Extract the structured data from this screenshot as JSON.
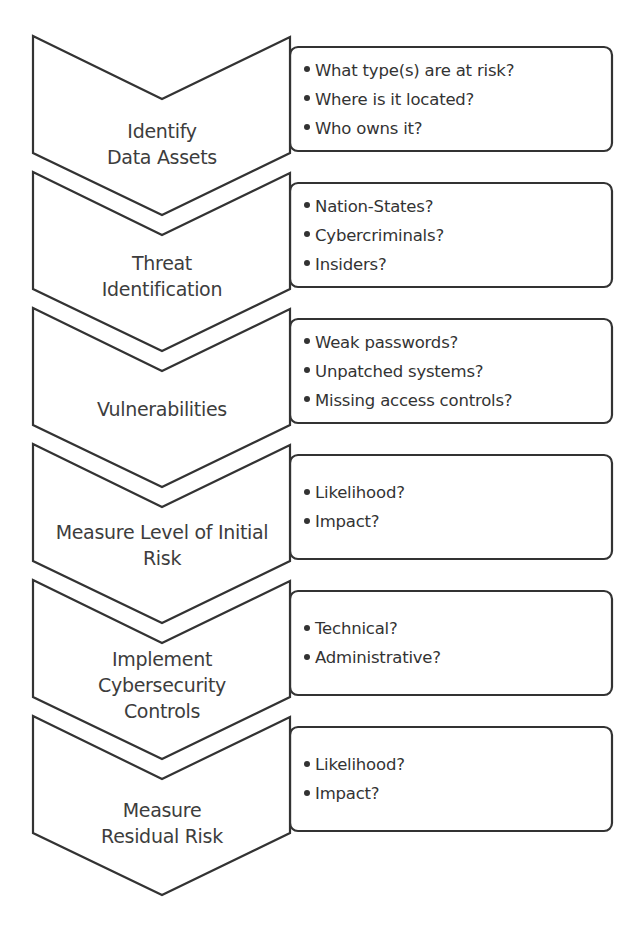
{
  "diagram": {
    "type": "vertical chevron process",
    "stroke_color": "#333333",
    "steps": [
      {
        "label_lines": [
          "Identify",
          "Data Assets"
        ],
        "bullets": [
          "What type(s) are at risk?",
          "Where is it located?",
          "Who owns it?"
        ]
      },
      {
        "label_lines": [
          "Threat",
          "Identification"
        ],
        "bullets": [
          "Nation-States?",
          "Cybercriminals?",
          "Insiders?"
        ]
      },
      {
        "label_lines": [
          "Vulnerabilities"
        ],
        "bullets": [
          "Weak passwords?",
          "Unpatched systems?",
          "Missing access controls?"
        ]
      },
      {
        "label_lines": [
          "Measure Level of Initial",
          "Risk"
        ],
        "bullets": [
          "Likelihood?",
          "Impact?"
        ]
      },
      {
        "label_lines": [
          "Implement",
          "Cybersecurity",
          "Controls"
        ],
        "bullets": [
          "Technical?",
          "Administrative?"
        ]
      },
      {
        "label_lines": [
          "Measure",
          "Residual Risk"
        ],
        "bullets": [
          "Likelihood?",
          "Impact?"
        ]
      }
    ]
  }
}
